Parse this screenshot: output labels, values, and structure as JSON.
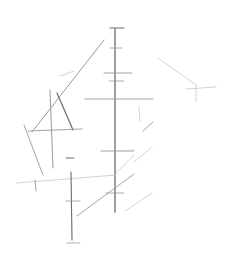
{
  "sketch": {
    "width": 234,
    "height": 262,
    "background": "#ffffff",
    "stroke_dark": "#6a6a6a",
    "stroke_mid": "#9a9a9a",
    "stroke_light": "#c8c8c8",
    "lines": [
      {
        "id": "main-vertical-axis",
        "x1": 115,
        "y1": 29,
        "x2": 115,
        "y2": 212,
        "tone": "dark",
        "w": 1.3
      },
      {
        "id": "top-cap",
        "x1": 110,
        "y1": 28,
        "x2": 124,
        "y2": 28,
        "tone": "dark",
        "w": 1
      },
      {
        "id": "tick-1",
        "x1": 110,
        "y1": 48,
        "x2": 122,
        "y2": 48,
        "tone": "mid",
        "w": 0.8
      },
      {
        "id": "tick-2",
        "x1": 104,
        "y1": 73,
        "x2": 132,
        "y2": 73,
        "tone": "mid",
        "w": 0.9
      },
      {
        "id": "tick-3",
        "x1": 109,
        "y1": 81,
        "x2": 124,
        "y2": 81,
        "tone": "mid",
        "w": 0.8
      },
      {
        "id": "h-line-mid",
        "x1": 85,
        "y1": 99,
        "x2": 153,
        "y2": 99,
        "tone": "mid",
        "w": 0.9
      },
      {
        "id": "tick-4",
        "x1": 101,
        "y1": 151,
        "x2": 134,
        "y2": 151,
        "tone": "mid",
        "w": 0.9
      },
      {
        "id": "tick-5",
        "x1": 106,
        "y1": 193,
        "x2": 124,
        "y2": 193,
        "tone": "mid",
        "w": 0.8
      },
      {
        "id": "long-diagonal",
        "x1": 104,
        "y1": 40,
        "x2": 32,
        "y2": 132,
        "tone": "mid",
        "w": 1
      },
      {
        "id": "short-dash-left",
        "x1": 60,
        "y1": 76,
        "x2": 74,
        "y2": 71,
        "tone": "light",
        "w": 0.8
      },
      {
        "id": "left-vertical",
        "x1": 50,
        "y1": 90,
        "x2": 53,
        "y2": 168,
        "tone": "mid",
        "w": 1
      },
      {
        "id": "left-slant",
        "x1": 57,
        "y1": 93,
        "x2": 73,
        "y2": 130,
        "tone": "dark",
        "w": 1.2
      },
      {
        "id": "left-h-line",
        "x1": 28,
        "y1": 131,
        "x2": 82,
        "y2": 129,
        "tone": "mid",
        "w": 0.9
      },
      {
        "id": "far-left-slant",
        "x1": 24,
        "y1": 125,
        "x2": 43,
        "y2": 175,
        "tone": "mid",
        "w": 0.9
      },
      {
        "id": "small-dash-1",
        "x1": 66,
        "y1": 158,
        "x2": 74,
        "y2": 158,
        "tone": "dark",
        "w": 1
      },
      {
        "id": "lower-h-line",
        "x1": 17,
        "y1": 183,
        "x2": 116,
        "y2": 175,
        "tone": "light",
        "w": 0.8
      },
      {
        "id": "small-vertical-1",
        "x1": 35,
        "y1": 180,
        "x2": 36,
        "y2": 191,
        "tone": "mid",
        "w": 0.9
      },
      {
        "id": "lower-vertical",
        "x1": 71,
        "y1": 172,
        "x2": 72,
        "y2": 240,
        "tone": "dark",
        "w": 1.1
      },
      {
        "id": "lower-tick",
        "x1": 66,
        "y1": 201,
        "x2": 80,
        "y2": 201,
        "tone": "mid",
        "w": 0.8
      },
      {
        "id": "bottom-cap",
        "x1": 67,
        "y1": 243,
        "x2": 80,
        "y2": 243,
        "tone": "mid",
        "w": 0.8
      },
      {
        "id": "cross-diagonal",
        "x1": 77,
        "y1": 216,
        "x2": 134,
        "y2": 174,
        "tone": "mid",
        "w": 0.9
      },
      {
        "id": "upper-right-diag",
        "x1": 116,
        "y1": 173,
        "x2": 134,
        "y2": 155,
        "tone": "light",
        "w": 0.8
      },
      {
        "id": "right-diag-1",
        "x1": 134,
        "y1": 162,
        "x2": 152,
        "y2": 147,
        "tone": "light",
        "w": 0.8
      },
      {
        "id": "right-diag-2",
        "x1": 125,
        "y1": 211,
        "x2": 152,
        "y2": 193,
        "tone": "light",
        "w": 0.8
      },
      {
        "id": "right-short-h",
        "x1": 118,
        "y1": 151,
        "x2": 134,
        "y2": 150,
        "tone": "light",
        "w": 0.8
      },
      {
        "id": "small-vertical-2",
        "x1": 139,
        "y1": 107,
        "x2": 140,
        "y2": 121,
        "tone": "light",
        "w": 0.8
      },
      {
        "id": "tail-diag",
        "x1": 143,
        "y1": 131,
        "x2": 153,
        "y2": 122,
        "tone": "mid",
        "w": 0.9
      },
      {
        "id": "far-right-diag",
        "x1": 158,
        "y1": 58,
        "x2": 196,
        "y2": 85,
        "tone": "light",
        "w": 0.8
      },
      {
        "id": "far-right-h",
        "x1": 186,
        "y1": 89,
        "x2": 216,
        "y2": 87,
        "tone": "light",
        "w": 0.8
      },
      {
        "id": "far-right-v",
        "x1": 196,
        "y1": 85,
        "x2": 196,
        "y2": 102,
        "tone": "light",
        "w": 0.8
      }
    ]
  }
}
